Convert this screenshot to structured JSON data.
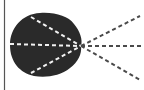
{
  "diagram": {
    "type": "ray-diagram",
    "colors": {
      "background": "#ffffff",
      "blob": "#2a2a2a",
      "rays_inside": "#f2f2f2",
      "rays_outside": "#4a4a4a",
      "edge_line": "#555555"
    },
    "focal_point": {
      "x": 81,
      "y": 46
    },
    "rays": [
      {
        "name": "upper",
        "from": [
          30,
          17
        ],
        "to": [
          140,
          16
        ]
      },
      {
        "name": "center",
        "from": [
          10,
          44
        ],
        "to": [
          144,
          46
        ]
      },
      {
        "name": "lower",
        "from": [
          30,
          73
        ],
        "to": [
          140,
          80
        ]
      }
    ]
  }
}
